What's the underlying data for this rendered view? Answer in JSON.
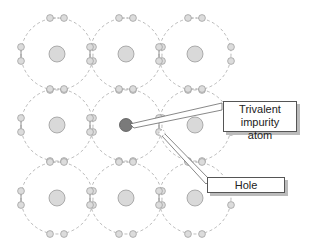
{
  "diagram": {
    "labels": {
      "impurity": "Trivalent impurity atom",
      "impurity_line1": "Trivalent impurity",
      "impurity_line2": "atom",
      "hole": "Hole"
    },
    "colors": {
      "atom": "#d9d9d9",
      "atom_stroke": "#9a9a9a",
      "impurity": "#7a7a7a",
      "orbit": "#a8a8a8",
      "electron": "#dcdcdc"
    },
    "grid": {
      "columns_x": [
        57,
        126,
        195
      ],
      "rows_y": [
        54,
        125,
        198
      ],
      "orbit_radius": 36,
      "impurity_cell": [
        1,
        1
      ]
    }
  }
}
